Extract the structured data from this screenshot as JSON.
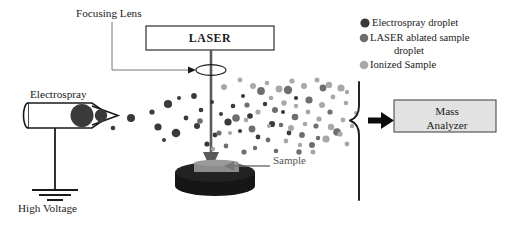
{
  "figure": {
    "type": "schematic-diagram",
    "background_color": "#ffffff"
  },
  "labels": {
    "focusing_lens": "Focusing Lens",
    "laser": "LASER",
    "electrospray": "Electrospray",
    "high_voltage": "High Voltage",
    "sample": "Sample",
    "mass_analyzer": "Mass\nAnalyzer",
    "mass_analyzer_line1": "Mass",
    "mass_analyzer_line2": "Analyzer"
  },
  "legend": {
    "items": [
      {
        "label": "Electrospray droplet",
        "label_line2": "",
        "color": "#3a3a3a",
        "radius": 4.6
      },
      {
        "label": "LASER ablated sample",
        "label_line2": "droplet",
        "color": "#6e6e6e",
        "radius": 4.2
      },
      {
        "label": "Ionized Sample",
        "label_line2": "",
        "color": "#a8a8a8",
        "radius": 4.2
      }
    ]
  },
  "colors": {
    "stroke": "#1a1a1a",
    "electrospray_droplet": "#3a3a3a",
    "ablated_droplet": "#6e6e6e",
    "ionized_sample": "#a8a8a8",
    "laser_beam": "#5a5a5a",
    "sample_stage": "#161616",
    "sample_slab": "#8c8c8c",
    "mass_analyzer_fill": "#e2e2e2",
    "leader_gray": "#777777"
  },
  "chart_data": {
    "type": "scatter",
    "xlabel": "",
    "ylabel": "",
    "series": [
      {
        "name": "Electrospray droplet",
        "color": "#3a3a3a",
        "points": [
          [
            131,
            118,
            4.0
          ],
          [
            152,
            112,
            2.6
          ],
          [
            158,
            127,
            3.6
          ],
          [
            168,
            104,
            4.1
          ],
          [
            176,
            133,
            4.3
          ],
          [
            186,
            118,
            2.4
          ],
          [
            194,
            96,
            2.9
          ],
          [
            197,
            126,
            3.0
          ],
          [
            201,
            110,
            2.3
          ],
          [
            212,
            102,
            2.0
          ],
          [
            215,
            135,
            2.4
          ],
          [
            207,
            144,
            2.6
          ],
          [
            228,
            122,
            3.6
          ],
          [
            233,
            106,
            2.3
          ],
          [
            240,
            131,
            2.1
          ],
          [
            250,
            116,
            2.8
          ],
          [
            243,
            96,
            2.0
          ],
          [
            258,
            137,
            2.4
          ],
          [
            265,
            104,
            2.2
          ],
          [
            272,
            124,
            3.1
          ],
          [
            283,
            112,
            2.0
          ],
          [
            289,
            133,
            2.4
          ],
          [
            100,
            121,
            2.2
          ],
          [
            113,
            128,
            2.3
          ],
          [
            296,
            98,
            2.1
          ],
          [
            221,
            114,
            2.0
          ],
          [
            179,
            98,
            2.0
          ],
          [
            164,
            140,
            2.0
          ]
        ]
      },
      {
        "name": "LASER ablated sample droplet",
        "color": "#6e6e6e",
        "points": [
          [
            200,
            121,
            2.8
          ],
          [
            219,
            133,
            2.6
          ],
          [
            236,
            118,
            3.8
          ],
          [
            247,
            105,
            2.6
          ],
          [
            252,
            129,
            3.4
          ],
          [
            261,
            91,
            3.9
          ],
          [
            268,
            140,
            2.4
          ],
          [
            275,
            110,
            3.0
          ],
          [
            281,
            125,
            2.3
          ],
          [
            288,
            90,
            4.2
          ],
          [
            295,
            117,
            3.3
          ],
          [
            302,
            135,
            2.9
          ],
          [
            309,
            100,
            3.6
          ],
          [
            316,
            126,
            2.6
          ],
          [
            323,
            88,
            3.4
          ],
          [
            312,
            145,
            3.0
          ],
          [
            330,
            112,
            2.6
          ],
          [
            337,
            132,
            3.8
          ],
          [
            226,
            146,
            2.4
          ],
          [
            244,
            152,
            2.6
          ],
          [
            276,
            151,
            2.3
          ],
          [
            299,
            152,
            2.7
          ],
          [
            255,
            148,
            2.2
          ],
          [
            318,
            138,
            2.2
          ]
        ]
      },
      {
        "name": "Ionized Sample",
        "color": "#a8a8a8",
        "points": [
          [
            224,
            87,
            3.0
          ],
          [
            240,
            80,
            2.4
          ],
          [
            253,
            86,
            3.0
          ],
          [
            267,
            83,
            2.3
          ],
          [
            279,
            89,
            3.4
          ],
          [
            292,
            81,
            2.6
          ],
          [
            304,
            86,
            3.0
          ],
          [
            317,
            80,
            2.5
          ],
          [
            329,
            85,
            3.2
          ],
          [
            341,
            88,
            3.6
          ],
          [
            333,
            97,
            2.4
          ],
          [
            346,
            103,
            2.3
          ],
          [
            322,
            105,
            3.0
          ],
          [
            308,
            112,
            2.4
          ],
          [
            296,
            106,
            2.2
          ],
          [
            284,
            103,
            2.8
          ],
          [
            271,
            98,
            2.3
          ],
          [
            258,
            112,
            2.6
          ],
          [
            246,
            120,
            2.3
          ],
          [
            291,
            128,
            3.0
          ],
          [
            305,
            124,
            2.3
          ],
          [
            319,
            119,
            2.6
          ],
          [
            331,
            127,
            3.2
          ],
          [
            343,
            120,
            2.4
          ],
          [
            326,
            139,
            3.6
          ],
          [
            340,
            134,
            2.6
          ],
          [
            347,
            144,
            2.4
          ],
          [
            313,
            152,
            2.5
          ],
          [
            286,
            141,
            2.4
          ],
          [
            300,
            145,
            2.2
          ],
          [
            352,
            126,
            2.2
          ],
          [
            356,
            113,
            2.0
          ],
          [
            230,
            133,
            2.0
          ],
          [
            213,
            149,
            2.2
          ],
          [
            269,
            126,
            2.1
          ],
          [
            347,
            92,
            2.2
          ]
        ]
      }
    ]
  },
  "components": {
    "laser_box": {
      "x": 146,
      "y": 26,
      "width": 128,
      "height": 24
    },
    "focusing_lens": {
      "cx": 211,
      "cy": 70,
      "rx": 15,
      "ry": 5.5
    },
    "laser_beam": {
      "x": 211,
      "y_top": 50,
      "y_bottom": 166
    },
    "sample_stage": {
      "cx": 215,
      "cy": 176,
      "rx": 40,
      "ry": 10,
      "height": 16
    },
    "sample_slab": {
      "x": 195,
      "y": 160,
      "width": 44,
      "height": 9
    },
    "electrospray_capillary": {
      "x": 28,
      "y": 103,
      "width": 74,
      "height": 25
    },
    "ground_symbol": {
      "x": 55,
      "y": 190
    },
    "collection_bracket": {
      "x": 366,
      "y_top": 82,
      "y_bottom": 200
    },
    "inlet_arrow": {
      "x": 372,
      "y": 121,
      "length": 26
    },
    "mass_analyzer_box": {
      "x": 394,
      "y": 98,
      "width": 104,
      "height": 32
    }
  }
}
